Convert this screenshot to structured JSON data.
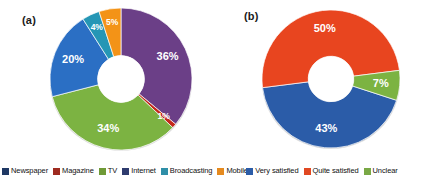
{
  "figure": {
    "background": "#ffffff"
  },
  "panels": [
    {
      "label": "(a)"
    },
    {
      "label": "(b)"
    }
  ],
  "legend_a": {
    "items": [
      {
        "label": "Newspaper",
        "color": "#1f3864"
      },
      {
        "label": "Magazine",
        "color": "#9e2b20"
      },
      {
        "label": "TV",
        "color": "#6f9a37"
      },
      {
        "label": "Internet",
        "color": "#2e3b6e"
      },
      {
        "label": "Broadcasting",
        "color": "#2f8fa8"
      },
      {
        "label": "Mobile",
        "color": "#e58a1f"
      }
    ]
  },
  "legend_b": {
    "items": [
      {
        "label": "Very satisfied",
        "color": "#2b5ca8"
      },
      {
        "label": "Quite satisfied",
        "color": "#e04822"
      },
      {
        "label": "Unclear",
        "color": "#79a845"
      }
    ]
  },
  "chart_data": [
    {
      "type": "pie",
      "variant": "donut",
      "title": "(a)",
      "categories": [
        "Newspaper",
        "Magazine",
        "TV",
        "Internet",
        "Broadcasting",
        "Mobile"
      ],
      "values": [
        36,
        1,
        34,
        20,
        4,
        5
      ],
      "labels": [
        "36%",
        "1%",
        "34%",
        "20%",
        "4%",
        "5%"
      ],
      "colors": [
        "#6b3f87",
        "#c4281c",
        "#7cb342",
        "#2b6fc4",
        "#2596b5",
        "#f39317"
      ],
      "units": "percent",
      "legend_position": "bottom",
      "inner_radius_ratio": 0.33,
      "start_angle_deg": -90,
      "direction": "clockwise"
    },
    {
      "type": "pie",
      "variant": "donut",
      "title": "(b)",
      "categories": [
        "Very satisfied",
        "Quite satisfied",
        "Unclear"
      ],
      "values": [
        43,
        50,
        7
      ],
      "labels": [
        "43%",
        "50%",
        "7%"
      ],
      "colors": [
        "#2b5ca8",
        "#e8451f",
        "#7cb342"
      ],
      "units": "percent",
      "legend_position": "bottom",
      "inner_radius_ratio": 0.33,
      "start_angle_deg": 18,
      "direction": "clockwise"
    }
  ]
}
